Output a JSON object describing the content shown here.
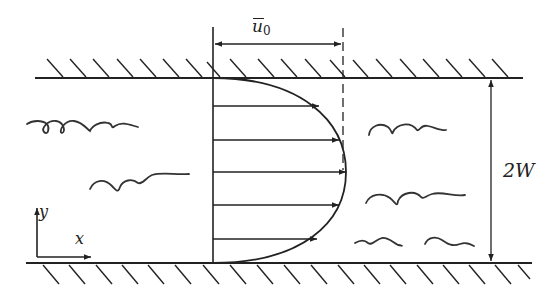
{
  "diagram": {
    "labels": {
      "mean_velocity_symbol": "u",
      "mean_velocity_subscript": "0",
      "channel_width": "2W",
      "x_axis": "x",
      "y_axis": "y"
    },
    "colors": {
      "stroke": "#222222",
      "background": "#ffffff"
    },
    "walls": {
      "top": {
        "y": 78,
        "x_start": 35,
        "x_end": 523,
        "hatch_side": "above"
      },
      "bottom": {
        "y": 263,
        "x_start": 26,
        "x_end": 532,
        "hatch_side": "below"
      }
    },
    "profile": {
      "origin_x": 213,
      "max_x": 346,
      "arrows": [
        {
          "y": 106,
          "tip_x": 319
        },
        {
          "y": 140,
          "tip_x": 339
        },
        {
          "y": 172,
          "tip_x": 346
        },
        {
          "y": 205,
          "tip_x": 339
        },
        {
          "y": 239,
          "tip_x": 317
        }
      ]
    },
    "dimension_u0": {
      "y": 44,
      "x_start": 213,
      "x_end": 343
    },
    "dimension_2w": {
      "x": 491,
      "y_start": 78,
      "y_end": 263
    },
    "eddies": [
      "left-upper-coil",
      "left-middle-wave",
      "right-upper-wave",
      "right-middle-wave",
      "right-lower-wave-1",
      "right-lower-wave-2"
    ]
  }
}
